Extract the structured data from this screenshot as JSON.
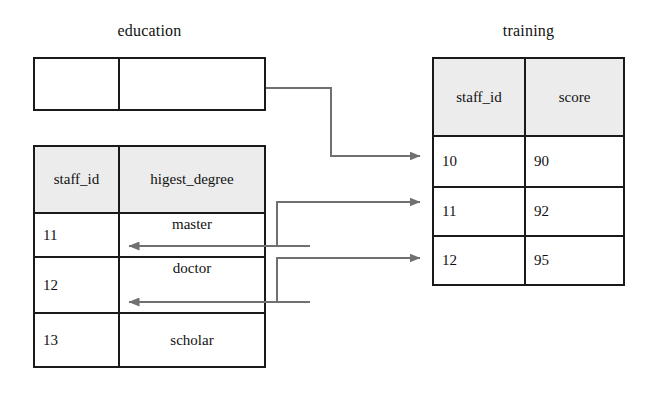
{
  "diagram": {
    "kind": "database-table-relationship-diagram",
    "accent_line_color": "#707070",
    "border_color": "#1a1a1a",
    "header_fill_color": "#ececec",
    "background_color": "#ffffff"
  },
  "education_table": {
    "title": "education",
    "rows": [
      {
        "cells": [
          "",
          ""
        ]
      }
    ]
  },
  "degree_table": {
    "columns": [
      "staff_id",
      "higest_degree"
    ],
    "rows": [
      {
        "staff_id": "11",
        "higest_degree": "master"
      },
      {
        "staff_id": "12",
        "higest_degree": "doctor"
      },
      {
        "staff_id": "13",
        "higest_degree": "scholar"
      }
    ]
  },
  "training_table": {
    "title": "training",
    "columns": [
      "staff_id",
      "score"
    ],
    "rows": [
      {
        "staff_id": "10",
        "score": "90"
      },
      {
        "staff_id": "11",
        "score": "92"
      },
      {
        "staff_id": "12",
        "score": "95"
      }
    ]
  },
  "connectors": [
    {
      "name": "education-to-training-10",
      "from": "education-table",
      "to": "training-row-10",
      "direction": "right"
    },
    {
      "name": "degree-11-to-training-11",
      "from": "degree-row-11",
      "to": "training-row-11",
      "direction": "right"
    },
    {
      "name": "degree-12-to-training-12",
      "from": "degree-row-12",
      "to": "training-row-12",
      "direction": "right"
    },
    {
      "name": "training-11-to-degree-11",
      "from": "training-row-11",
      "to": "degree-row-11",
      "direction": "left"
    },
    {
      "name": "training-12-to-degree-12",
      "from": "training-row-12",
      "to": "degree-row-12",
      "direction": "left"
    }
  ]
}
